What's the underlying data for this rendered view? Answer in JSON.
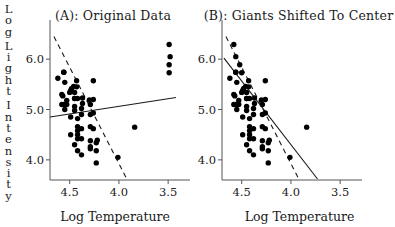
{
  "figure": {
    "xlabel": "Log Temperature",
    "ylabel_chars": [
      "L",
      "o",
      "g",
      "L",
      "i",
      "g",
      "h",
      "t",
      "I",
      "n",
      "t",
      "e",
      "n",
      "s",
      "i",
      "t",
      "y"
    ],
    "ylabel_text": "Log Light Intensity"
  },
  "panel_a": {
    "title": "(A): Original Data",
    "xticks": [
      "4.5",
      "4.0",
      "3.5"
    ],
    "yticks": [
      "6.0",
      "5.0",
      "4.0"
    ]
  },
  "panel_b": {
    "title": "(B): Giants Shifted To Center",
    "xticks": [
      "4.5",
      "4.0",
      "3.5"
    ],
    "yticks": [
      "6.0",
      "5.0",
      "4.0"
    ]
  },
  "chart_data": [
    {
      "type": "scatter",
      "title": "(A): Original Data",
      "xlabel": "Log Temperature",
      "ylabel": "Log Light Intensity",
      "xlim": [
        4.7,
        3.4
      ],
      "ylim": [
        3.6,
        6.5
      ],
      "x_axis_reversed": true,
      "grid": false,
      "legend": "none",
      "xticks": [
        4.5,
        4.0,
        3.5
      ],
      "yticks": [
        6.0,
        5.0,
        4.0
      ],
      "points": [
        [
          4.37,
          5.23
        ],
        [
          4.56,
          5.74
        ],
        [
          4.26,
          4.93
        ],
        [
          4.56,
          5.74
        ],
        [
          4.3,
          5.19
        ],
        [
          4.46,
          5.46
        ],
        [
          3.84,
          4.65
        ],
        [
          4.57,
          5.27
        ],
        [
          4.26,
          5.57
        ],
        [
          4.37,
          5.12
        ],
        [
          3.49,
          5.73
        ],
        [
          4.43,
          5.45
        ],
        [
          4.48,
          5.42
        ],
        [
          4.01,
          4.05
        ],
        [
          4.29,
          4.26
        ],
        [
          4.42,
          4.58
        ],
        [
          4.23,
          3.94
        ],
        [
          4.42,
          4.18
        ],
        [
          4.23,
          4.18
        ],
        [
          3.49,
          5.89
        ],
        [
          4.29,
          4.38
        ],
        [
          4.29,
          4.22
        ],
        [
          4.42,
          4.42
        ],
        [
          4.49,
          4.85
        ],
        [
          4.38,
          5.02
        ],
        [
          4.42,
          4.66
        ],
        [
          4.29,
          4.66
        ],
        [
          4.38,
          4.9
        ],
        [
          4.22,
          4.39
        ],
        [
          3.48,
          6.05
        ],
        [
          4.38,
          4.42
        ],
        [
          4.56,
          5.1
        ],
        [
          4.45,
          5.22
        ],
        [
          3.49,
          6.29
        ],
        [
          4.23,
          4.34
        ],
        [
          4.62,
          5.62
        ],
        [
          4.53,
          5.1
        ],
        [
          4.45,
          5.22
        ],
        [
          4.53,
          5.18
        ],
        [
          4.43,
          5.57
        ],
        [
          4.38,
          4.62
        ],
        [
          4.45,
          5.06
        ],
        [
          4.5,
          5.34
        ],
        [
          4.45,
          5.34
        ],
        [
          4.55,
          5.54
        ],
        [
          4.45,
          4.98
        ],
        [
          4.42,
          4.5
        ],
        [
          4.49,
          4.5
        ],
        [
          4.38,
          4.1
        ],
        [
          4.45,
          4.3
        ],
        [
          4.26,
          4.62
        ],
        [
          4.26,
          5.2
        ],
        [
          4.29,
          5.1
        ],
        [
          4.42,
          5.22
        ],
        [
          4.55,
          5.0
        ],
        [
          4.29,
          4.9
        ],
        [
          4.58,
          5.3
        ],
        [
          4.49,
          5.38
        ],
        [
          4.58,
          5.1
        ],
        [
          4.42,
          4.82
        ]
      ],
      "fits": [
        {
          "name": "least-squares-fit",
          "style": "solid",
          "x1": 4.7,
          "y1": 4.85,
          "x2": 3.42,
          "y2": 5.24
        },
        {
          "name": "robust-fit",
          "style": "dashed",
          "x1": 4.66,
          "y1": 6.45,
          "x2": 3.92,
          "y2": 3.62
        }
      ]
    },
    {
      "type": "scatter",
      "title": "(B): Giants Shifted To Center",
      "xlabel": "Log Temperature",
      "ylabel": "Log Light Intensity",
      "xlim": [
        4.7,
        3.4
      ],
      "ylim": [
        3.6,
        6.5
      ],
      "x_axis_reversed": true,
      "grid": false,
      "legend": "none",
      "xticks": [
        4.5,
        4.0,
        3.5
      ],
      "yticks": [
        6.0,
        5.0,
        4.0
      ],
      "points": [
        [
          4.37,
          5.23
        ],
        [
          4.56,
          5.74
        ],
        [
          4.26,
          4.93
        ],
        [
          4.56,
          5.74
        ],
        [
          4.3,
          5.19
        ],
        [
          4.46,
          5.46
        ],
        [
          3.84,
          4.65
        ],
        [
          4.57,
          5.27
        ],
        [
          4.26,
          5.57
        ],
        [
          4.37,
          5.12
        ],
        [
          4.58,
          6.29
        ],
        [
          4.43,
          5.45
        ],
        [
          4.48,
          5.42
        ],
        [
          4.01,
          4.05
        ],
        [
          4.29,
          4.26
        ],
        [
          4.42,
          4.58
        ],
        [
          4.23,
          3.94
        ],
        [
          4.42,
          4.18
        ],
        [
          4.23,
          4.18
        ],
        [
          4.56,
          6.05
        ],
        [
          4.29,
          4.38
        ],
        [
          4.29,
          4.22
        ],
        [
          4.42,
          4.42
        ],
        [
          4.49,
          4.85
        ],
        [
          4.38,
          5.02
        ],
        [
          4.42,
          4.66
        ],
        [
          4.29,
          4.66
        ],
        [
          4.38,
          4.9
        ],
        [
          4.22,
          4.39
        ],
        [
          4.52,
          5.89
        ],
        [
          4.38,
          4.42
        ],
        [
          4.56,
          5.1
        ],
        [
          4.45,
          5.22
        ],
        [
          4.5,
          5.73
        ],
        [
          4.23,
          4.34
        ],
        [
          4.62,
          5.62
        ],
        [
          4.53,
          5.1
        ],
        [
          4.45,
          5.22
        ],
        [
          4.53,
          5.18
        ],
        [
          4.43,
          5.57
        ],
        [
          4.38,
          4.62
        ],
        [
          4.45,
          5.06
        ],
        [
          4.5,
          5.34
        ],
        [
          4.45,
          5.34
        ],
        [
          4.55,
          5.54
        ],
        [
          4.45,
          4.98
        ],
        [
          4.42,
          4.5
        ],
        [
          4.49,
          4.5
        ],
        [
          4.38,
          4.1
        ],
        [
          4.45,
          4.3
        ],
        [
          4.26,
          4.62
        ],
        [
          4.26,
          5.2
        ],
        [
          4.29,
          5.1
        ],
        [
          4.42,
          5.22
        ],
        [
          4.55,
          5.0
        ],
        [
          4.29,
          4.9
        ],
        [
          4.58,
          5.3
        ],
        [
          4.49,
          5.38
        ],
        [
          4.58,
          5.1
        ],
        [
          4.42,
          4.82
        ]
      ],
      "fits": [
        {
          "name": "least-squares-fit",
          "style": "solid",
          "x1": 4.68,
          "y1": 6.02,
          "x2": 3.73,
          "y2": 3.62
        },
        {
          "name": "robust-fit",
          "style": "dashed",
          "x1": 4.66,
          "y1": 6.45,
          "x2": 3.92,
          "y2": 3.62
        }
      ]
    }
  ]
}
